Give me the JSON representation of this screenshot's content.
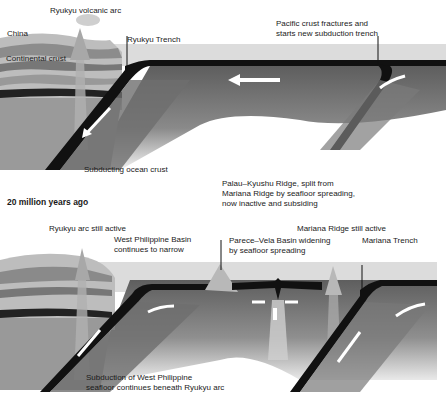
{
  "panel_top": {
    "labels": {
      "volcanic_arc": "Ryukyu volcanic arc",
      "china": "China",
      "continental_crust": "Continental crust",
      "trench": "Ryukyu Trench",
      "pacific_fracture_line1": "Pacific crust fractures and",
      "pacific_fracture_line2": "starts new subduction trench",
      "subducting": "Subducting ocean crust"
    }
  },
  "panel_bottom": {
    "title": "20 million years ago",
    "labels": {
      "ryukyu_active": "Ryukyu arc still active",
      "wpb_line1": "West Philippine Basin",
      "wpb_line2": "continues to narrow",
      "palau_line1": "Palau–Kyushu Ridge, split from",
      "palau_line2": "Mariana Ridge by seafloor spreading,",
      "palau_line3": "now inactive and subsiding",
      "mariana_active": "Mariana Ridge still active",
      "parece_line1": "Parece–Vela Basin widening",
      "parece_line2": "by seafloor spreading",
      "mariana_trench": "Mariana Trench",
      "subduction_line1": "Subduction of West Philippine",
      "subduction_line2": "seafloor continues beneath Ryukyu arc"
    }
  },
  "colors": {
    "ocean": "#d8d8d8",
    "crust_line": "#111111",
    "mantle": "#7a7a7a",
    "strata_light": "#cfcfcf",
    "strata_dark": "#6a6a6a",
    "arrow": "#ffffff"
  }
}
